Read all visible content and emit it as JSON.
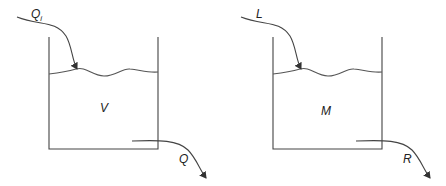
{
  "diagram": {
    "type": "tank-mass-balance",
    "stroke_color": "#444444",
    "tanks": [
      {
        "id": "left",
        "content_label": "V",
        "inflow_label": "Q",
        "inflow_subscript": "i",
        "outflow_label": "Q"
      },
      {
        "id": "right",
        "content_label": "M",
        "inflow_label": "L",
        "inflow_subscript": "",
        "outflow_label": "R"
      }
    ]
  }
}
